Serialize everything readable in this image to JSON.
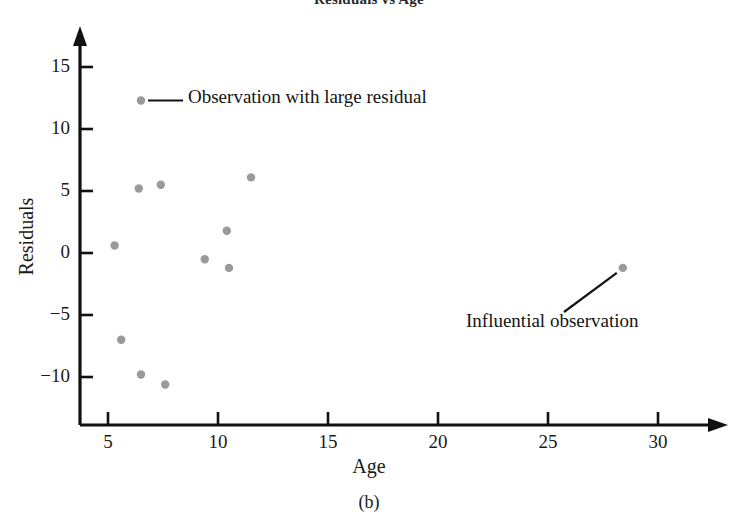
{
  "figure": {
    "title": "Residuals vs Age",
    "panel_caption": "(b)"
  },
  "axes": {
    "x_title": "Age",
    "y_title": "Residuals",
    "x_ticks": [
      "5",
      "10",
      "15",
      "20",
      "25",
      "30"
    ],
    "y_ticks": [
      "15",
      "10",
      "5",
      "0",
      "−5",
      "−10"
    ]
  },
  "annotations": {
    "large_residual": "Observation with large residual",
    "influential": "Influential observation"
  },
  "style": {
    "point_color": "#9a9a9a",
    "axis_color": "#111111",
    "text_color": "#1a1a1a"
  },
  "chart_data": {
    "type": "scatter",
    "title": "Residuals vs Age",
    "xlabel": "Age",
    "ylabel": "Residuals",
    "xlim": [
      3.8,
      31.5
    ],
    "ylim": [
      -12.5,
      17.0
    ],
    "xticks": [
      5,
      10,
      15,
      20,
      25,
      30
    ],
    "yticks": [
      15,
      10,
      5,
      0,
      -5,
      -10
    ],
    "grid": false,
    "legend": null,
    "series": [
      {
        "name": "Residuals",
        "points": [
          {
            "x": 6.5,
            "y": 12.3,
            "label": "Observation with large residual"
          },
          {
            "x": 5.3,
            "y": 0.6,
            "label": ""
          },
          {
            "x": 5.6,
            "y": -7.0,
            "label": ""
          },
          {
            "x": 6.4,
            "y": 5.2,
            "label": ""
          },
          {
            "x": 6.5,
            "y": -9.8,
            "label": ""
          },
          {
            "x": 7.4,
            "y": 5.5,
            "label": ""
          },
          {
            "x": 7.6,
            "y": -10.6,
            "label": ""
          },
          {
            "x": 9.4,
            "y": -0.5,
            "label": ""
          },
          {
            "x": 10.4,
            "y": 1.8,
            "label": ""
          },
          {
            "x": 10.5,
            "y": -1.2,
            "label": ""
          },
          {
            "x": 11.5,
            "y": 6.1,
            "label": ""
          },
          {
            "x": 28.4,
            "y": -1.2,
            "label": "Influential observation"
          }
        ]
      }
    ],
    "annotations": [
      {
        "text": "Observation with large residual",
        "points_to": {
          "x": 6.5,
          "y": 12.3
        }
      },
      {
        "text": "Influential observation",
        "points_to": {
          "x": 28.4,
          "y": -1.2
        }
      }
    ]
  }
}
